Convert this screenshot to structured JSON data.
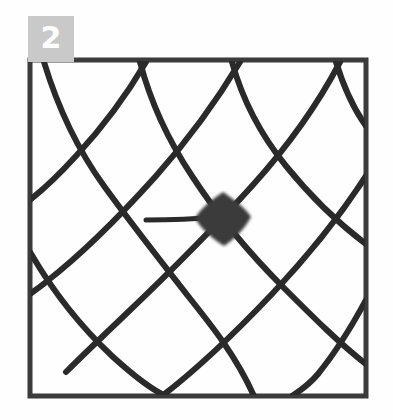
{
  "figure": {
    "panel_label": "2",
    "caption_text": "",
    "background_color": "#fefefe",
    "label_box_color": "#c9c9c9",
    "label_text_color": "#ffffff",
    "ink_color": "#2c2c2c",
    "blob_color": "#3b3b3b",
    "border_color": "#3a3a3a"
  },
  "chart_data": {
    "type": "diagram",
    "title": "",
    "subtitle": "",
    "xlabel": "",
    "ylabel": "",
    "grid": true,
    "legend": null,
    "frame": {
      "x": 30,
      "y": 60,
      "width": 336,
      "height": 336,
      "stroke_width": 5,
      "color": "#3a3a3a"
    },
    "stroke_width": 6,
    "ink_color": "#2c2c2c",
    "families": [
      {
        "name": "down-right-strokes",
        "count": 5,
        "paths": [
          "M 44 62 C 58 108, 78 150, 104 186 C 130 222, 160 260, 188 296 C 212 326, 236 356, 254 396",
          "M 140 62 C 150 100, 168 140, 192 176 C 218 216, 250 254, 284 288 C 312 316, 340 344, 366 364",
          "M 232 62 C 242 98, 260 134, 286 166 C 312 198, 342 226, 366 244",
          "M 336 62 C 344 88, 356 112, 366 126",
          "M 30 252 C 52 290, 80 326, 112 356 C 134 376, 152 390, 166 396"
        ]
      },
      {
        "name": "down-left-strokes",
        "count": 5,
        "paths": [
          "M 146 62 C 126 96, 102 128, 76 156 C 56 178, 40 192, 30 200",
          "M 240 62 C 216 102, 188 140, 156 176 C 120 216, 82 254, 46 282 C 40 287, 34 291, 30 294",
          "M 340 62 C 318 104, 288 146, 252 186 C 212 230, 168 274, 126 314 C 104 335, 84 354, 66 372",
          "M 366 176 C 340 216, 308 256, 272 294 C 234 334, 196 370, 162 396",
          "M 366 300 C 352 326, 336 352, 318 374 C 308 386, 298 392, 292 396"
        ]
      }
    ],
    "extra_strokes": [
      {
        "name": "short-tail-stroke",
        "path": "M 146 220 C 170 220, 196 219, 216 217",
        "stroke_width": 5
      }
    ],
    "filled_cell": {
      "name": "filled-mesh-cell",
      "shape": "diamond",
      "center_x": 223,
      "center_y": 219,
      "half_width": 28,
      "half_height": 27,
      "color": "#3b3b3b"
    },
    "annotations": []
  }
}
